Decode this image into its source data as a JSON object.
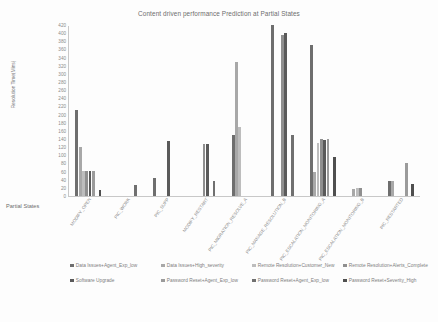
{
  "chart_data": {
    "type": "bar",
    "title": "Content driven performance Prediction at Partial States",
    "xlabel": "Partial States",
    "ylabel": "Resolution Time(Mins)",
    "ylim": [
      0,
      420
    ],
    "ytick_step": 20,
    "yticks": [
      0,
      20,
      40,
      60,
      80,
      100,
      120,
      140,
      160,
      180,
      200,
      220,
      240,
      260,
      280,
      300,
      320,
      340,
      360,
      380,
      400,
      420
    ],
    "grid": false,
    "legend_position": "bottom",
    "categories": [
      "MODIFY_OPEN",
      "PIC_WORK",
      "PIC_SUPP",
      "MODIFY_RESTART",
      "PIC_MIGRATION_RESOLVE_A",
      "PIC_MANAGE_RESOLUTION_B",
      "PIC_ESCALATION_MONITORING_A",
      "PIC_ESCALATION_MONITORING_B",
      "PIC_RESTARTED"
    ],
    "series": [
      {
        "name": "Data Issues+Agent_Exp_low",
        "color": "#6e6e6e",
        "values": [
          212,
          0,
          45,
          0,
          150,
          420,
          370,
          0,
          36
        ]
      },
      {
        "name": "Data Issues+High_severity",
        "color": "#a8a8a8",
        "values": [
          120,
          0,
          0,
          0,
          330,
          0,
          58,
          18,
          36
        ]
      },
      {
        "name": "Remote Resolution+Customer_New",
        "color": "#bdbdbd",
        "values": [
          62,
          0,
          0,
          0,
          170,
          0,
          130,
          20,
          0
        ]
      },
      {
        "name": "Remote Resolution+Alerts_Complete",
        "color": "#8f8f8f",
        "values": [
          62,
          0,
          0,
          128,
          0,
          395,
          140,
          20,
          0
        ]
      },
      {
        "name": "Software Upgrade",
        "color": "#5a5a5a",
        "values": [
          62,
          0,
          135,
          128,
          0,
          400,
          138,
          0,
          0
        ]
      },
      {
        "name": "Password Reset+Agent_Exp_low",
        "color": "#9b9b9b",
        "values": [
          62,
          0,
          0,
          0,
          0,
          0,
          140,
          0,
          82
        ]
      },
      {
        "name": "Password Reset+Agent_Exp_low ",
        "color": "#707070",
        "values": [
          0,
          28,
          0,
          38,
          0,
          150,
          0,
          0,
          0
        ]
      },
      {
        "name": "Password Reset+Severity_High",
        "color": "#4f4f4f",
        "values": [
          15,
          0,
          0,
          0,
          0,
          0,
          95,
          0,
          30
        ]
      }
    ]
  },
  "legend": {
    "row1": [
      "Data Issues+Agent_Exp_low",
      "Data Issues+High_severity",
      "Remote Resolution+Customer_New",
      "Remote Resolution+Alerts_Complete"
    ],
    "row2": [
      "Software Upgrade",
      "Password Reset+Agent_Exp_low",
      "Password Reset+Agent_Exp_low",
      "Password Reset+Severity_High"
    ]
  }
}
